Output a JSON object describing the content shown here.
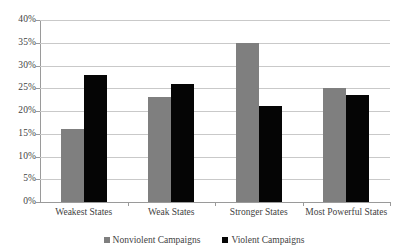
{
  "chart_data": {
    "type": "bar",
    "title": "",
    "subtitle": "",
    "xlabel": "",
    "ylabel": "",
    "ylim": [
      0,
      40
    ],
    "y_ticks": [
      "0%",
      "5%",
      "10%",
      "15%",
      "20%",
      "25%",
      "30%",
      "35%",
      "40%"
    ],
    "y_tick_values": [
      0,
      5,
      10,
      15,
      20,
      25,
      30,
      35,
      40
    ],
    "grid": true,
    "legend_position": "bottom",
    "categories": [
      "Weakest States",
      "Weak States",
      "Stronger States",
      "Most Powerful States"
    ],
    "series": [
      {
        "name": "Nonviolent Campaigns",
        "color": "#7f7f7f",
        "values": [
          16,
          23,
          35,
          25
        ]
      },
      {
        "name": "Violent Campaigns",
        "color": "#050505",
        "values": [
          28,
          26,
          21,
          23.5
        ]
      }
    ]
  },
  "legend": {
    "items": [
      {
        "label": "Nonviolent Campaigns",
        "marker": "square-swatch-gray"
      },
      {
        "label": "Violent Campaigns",
        "marker": "square-swatch-black"
      }
    ]
  }
}
